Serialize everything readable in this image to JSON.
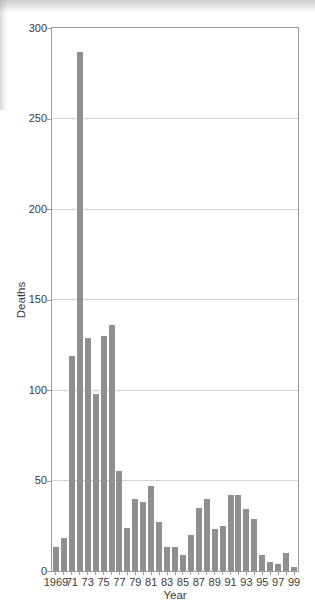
{
  "chart_data": {
    "type": "bar",
    "title": "",
    "xlabel": "Year",
    "ylabel": "Deaths",
    "ylim": [
      0,
      300
    ],
    "yticks": [
      0,
      50,
      100,
      150,
      200,
      250,
      300
    ],
    "grid": "horizontal",
    "legend": "none",
    "categories": [
      1969,
      1970,
      1971,
      1972,
      1973,
      1974,
      1975,
      1976,
      1977,
      1978,
      1979,
      1980,
      1981,
      1982,
      1983,
      1984,
      1985,
      1986,
      1987,
      1988,
      1989,
      1990,
      1991,
      1992,
      1993,
      1994,
      1995,
      1996,
      1997,
      1998,
      1999
    ],
    "xtick_labels": [
      "1969",
      "71",
      "73",
      "75",
      "77",
      "79",
      "81",
      "83",
      "85",
      "87",
      "89",
      "91",
      "93",
      "95",
      "97",
      "99"
    ],
    "values": [
      13,
      18,
      119,
      287,
      129,
      98,
      130,
      136,
      55,
      24,
      40,
      38,
      47,
      27,
      13,
      13,
      9,
      20,
      35,
      40,
      23,
      25,
      42,
      42,
      34,
      29,
      9,
      5,
      4,
      10,
      2
    ]
  },
  "colors": {
    "bar": "#8f8f8f",
    "grid": "#d2d2d2",
    "frame": "#9a9a9a",
    "text": "#3a3a3a"
  }
}
